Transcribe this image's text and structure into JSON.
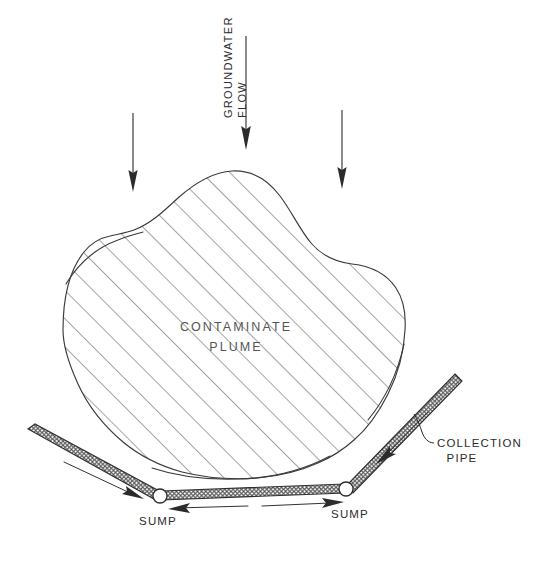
{
  "diagram": {
    "background_color": "#ffffff",
    "ink_color": "#2b2b2b",
    "width": 536,
    "height": 563,
    "labels": {
      "groundwater_flow_line1": "GROUNDWATER",
      "groundwater_flow_line2": "FLOW",
      "plume_line1": "CONTAMINATE",
      "plume_line2": "PLUME",
      "collection_pipe_line1": "COLLECTION",
      "collection_pipe_line2": "PIPE",
      "sump_left": "SUMP",
      "sump_right": "SUMP"
    },
    "elements": {
      "plume_name": "contaminate-plume",
      "plume_fill_pattern": "diagonal-hatch-45deg",
      "pipe_fill_pattern": "cross-hatch-mesh",
      "flow_arrow_count": 3,
      "sump_count": 2,
      "pipe_segment_count": 3
    }
  }
}
